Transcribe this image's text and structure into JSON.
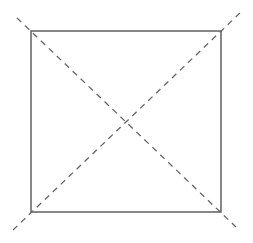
{
  "diagram": {
    "shapes": [
      {
        "id": "square",
        "kind": "square",
        "style": "solid"
      },
      {
        "id": "diagonal-1",
        "kind": "line",
        "style": "dashed",
        "from_corner": "top-left",
        "to_corner": "bottom-right",
        "extends_beyond_square": true
      },
      {
        "id": "diagonal-2",
        "kind": "line",
        "style": "dashed",
        "from_corner": "bottom-left",
        "to_corner": "top-right",
        "extends_beyond_square": true
      }
    ],
    "colors": {
      "background": "#ffffff",
      "square_stroke": "#555555",
      "diagonal_stroke": "#666666"
    },
    "labels": []
  }
}
